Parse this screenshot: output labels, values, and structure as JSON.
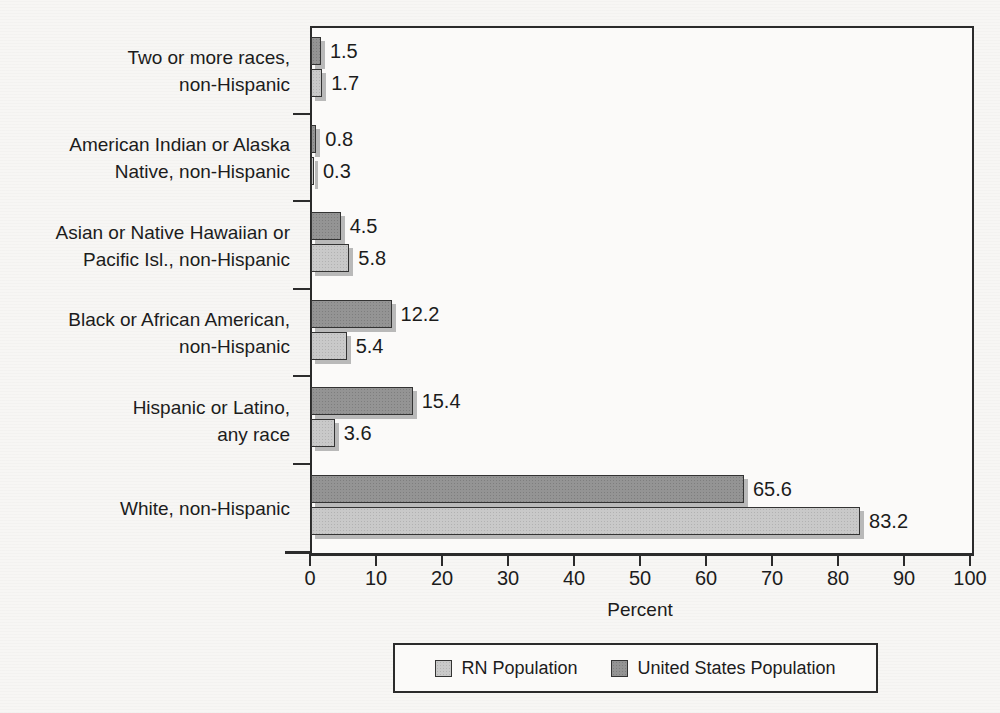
{
  "colors": {
    "rn_bar": "#c9c9c9",
    "us_bar": "#949494",
    "bar_border": "#333333",
    "bar_shadow": "#b9b9b9",
    "axis": "#2b2b2b",
    "text": "#1c1c1c",
    "page_bg": "#f7f6f4"
  },
  "chart_data": {
    "type": "bar",
    "orientation": "horizontal",
    "title": "",
    "xlabel": "Percent",
    "xlim": [
      0,
      100
    ],
    "xticks": [
      0,
      10,
      20,
      30,
      40,
      50,
      60,
      70,
      80,
      90,
      100
    ],
    "grid": false,
    "legend_position": "bottom",
    "bar_order_top_to_bottom": [
      "United States Population",
      "RN Population"
    ],
    "categories": [
      {
        "lines": [
          "Two or more races,",
          "non-Hispanic"
        ]
      },
      {
        "lines": [
          "American Indian or Alaska",
          "Native, non-Hispanic"
        ]
      },
      {
        "lines": [
          "Asian or Native Hawaiian or",
          "Pacific Isl., non-Hispanic"
        ]
      },
      {
        "lines": [
          "Black or African American,",
          "non-Hispanic"
        ]
      },
      {
        "lines": [
          "Hispanic or Latino,",
          "any race"
        ]
      },
      {
        "lines": [
          "White, non-Hispanic"
        ]
      }
    ],
    "series": [
      {
        "name": "United States Population",
        "key": "us",
        "values": [
          1.5,
          0.8,
          4.5,
          12.2,
          15.4,
          65.6
        ]
      },
      {
        "name": "RN Population",
        "key": "rn",
        "values": [
          1.7,
          0.3,
          5.8,
          5.4,
          3.6,
          83.2
        ]
      }
    ],
    "legend": [
      {
        "name": "RN Population",
        "key": "rn"
      },
      {
        "name": "United States Population",
        "key": "us"
      }
    ]
  }
}
